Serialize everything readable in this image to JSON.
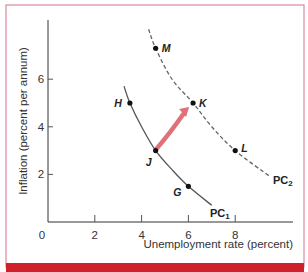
{
  "chart_data": {
    "type": "line",
    "title": "",
    "xlabel": "Unemployment rate (percent)",
    "ylabel": "Inflation (percent per annum)",
    "xlim": [
      0,
      10
    ],
    "ylim": [
      0,
      8.5
    ],
    "x_ticks": [
      "0",
      "2",
      "4",
      "6",
      "8"
    ],
    "y_ticks": [
      "2",
      "4",
      "6"
    ],
    "grid": false,
    "legend": "none (curves labeled inline)",
    "series": [
      {
        "name": "PC1",
        "label_main": "PC",
        "label_sub": "1",
        "style": "solid",
        "color": "#555555",
        "points": [
          [
            3.25,
            5.7
          ],
          [
            3.5,
            5.0
          ],
          [
            4.0,
            4.0
          ],
          [
            4.6,
            3.0
          ],
          [
            5.3,
            2.2
          ],
          [
            6.0,
            1.5
          ],
          [
            7.0,
            0.7
          ]
        ]
      },
      {
        "name": "PC2",
        "label_main": "PC",
        "label_sub": "2",
        "style": "dashed",
        "color": "#666666",
        "points": [
          [
            4.3,
            8.1
          ],
          [
            4.6,
            7.3
          ],
          [
            5.3,
            6.0
          ],
          [
            6.2,
            5.0
          ],
          [
            7.0,
            4.0
          ],
          [
            8.0,
            3.0
          ],
          [
            9.5,
            1.9
          ]
        ]
      }
    ],
    "labeled_points": [
      {
        "label": "M",
        "x": 4.6,
        "y": 7.3,
        "curve": "PC2"
      },
      {
        "label": "H",
        "x": 3.5,
        "y": 5.0,
        "curve": "PC1"
      },
      {
        "label": "K",
        "x": 6.2,
        "y": 5.0,
        "curve": "PC2"
      },
      {
        "label": "J",
        "x": 4.6,
        "y": 3.0,
        "curve": "PC1"
      },
      {
        "label": "L",
        "x": 8.0,
        "y": 3.0,
        "curve": "PC2"
      },
      {
        "label": "G",
        "x": 6.0,
        "y": 1.5,
        "curve": "PC1"
      }
    ],
    "annotations": [
      {
        "type": "arrow",
        "from": "J",
        "to": "K",
        "color": "#e0707a",
        "description": "Shift from point J on PC1 to point K on PC2"
      }
    ]
  },
  "colors": {
    "frame_border": "#d98a9a",
    "bottom_band": "#d0202a",
    "axis": "#333333",
    "arrow": "#e0707a"
  }
}
